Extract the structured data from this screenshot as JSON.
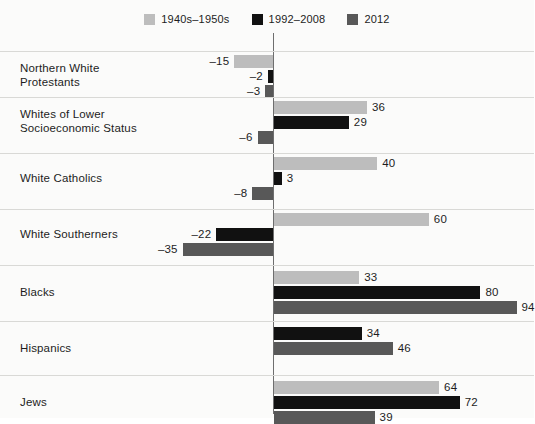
{
  "legend": {
    "position": "top-center",
    "entries": [
      {
        "label": "1940s–1950s",
        "color": "#bdbdbd",
        "key": "era1"
      },
      {
        "label": "1992–2008",
        "color": "#111111",
        "key": "era2"
      },
      {
        "label": "2012",
        "color": "#585858",
        "key": "era3"
      }
    ]
  },
  "axis": {
    "zero_line_color": "#6e6e6e",
    "gridline_color": "#d9d9d6",
    "min": -40,
    "max": 100
  },
  "chart_data": {
    "type": "bar",
    "orientation": "horizontal",
    "title": "",
    "subtitle": "",
    "xlabel": "",
    "ylabel": "",
    "xlim": [
      -40,
      100
    ],
    "grid": false,
    "legend_position": "top-center",
    "categories": [
      "Northern White Protestants",
      "Whites of Lower Socioeconomic Status",
      "White Catholics",
      "White Southerners",
      "Blacks",
      "Hispanics",
      "Jews"
    ],
    "series": [
      {
        "name": "1940s–1950s",
        "color": "#bdbdbd",
        "values": [
          -15,
          36,
          40,
          60,
          33,
          null,
          64
        ]
      },
      {
        "name": "1992–2008",
        "color": "#111111",
        "values": [
          -2,
          29,
          3,
          -22,
          80,
          34,
          72
        ]
      },
      {
        "name": "2012",
        "color": "#585858",
        "values": [
          -3,
          -6,
          -8,
          -35,
          94,
          46,
          39
        ]
      }
    ]
  },
  "groups": [
    {
      "label": "Northern White\nProtestants",
      "bars": [
        {
          "series": "1940s–1950s",
          "value": -15,
          "display": "–15",
          "color": "#bdbdbd"
        },
        {
          "series": "1992–2008",
          "value": -2,
          "display": "–2",
          "color": "#111111"
        },
        {
          "series": "2012",
          "value": -3,
          "display": "–3",
          "color": "#585858"
        }
      ]
    },
    {
      "label": "Whites of Lower\nSocioeconomic Status",
      "bars": [
        {
          "series": "1940s–1950s",
          "value": 36,
          "display": "36",
          "color": "#bdbdbd"
        },
        {
          "series": "1992–2008",
          "value": 29,
          "display": "29",
          "color": "#111111"
        },
        {
          "series": "2012",
          "value": -6,
          "display": "–6",
          "color": "#585858"
        }
      ]
    },
    {
      "label": "White Catholics",
      "bars": [
        {
          "series": "1940s–1950s",
          "value": 40,
          "display": "40",
          "color": "#bdbdbd"
        },
        {
          "series": "1992–2008",
          "value": 3,
          "display": "3",
          "color": "#111111"
        },
        {
          "series": "2012",
          "value": -8,
          "display": "–8",
          "color": "#585858"
        }
      ]
    },
    {
      "label": "White Southerners",
      "bars": [
        {
          "series": "1940s–1950s",
          "value": 60,
          "display": "60",
          "color": "#bdbdbd"
        },
        {
          "series": "1992–2008",
          "value": -22,
          "display": "–22",
          "color": "#111111"
        },
        {
          "series": "2012",
          "value": -35,
          "display": "–35",
          "color": "#585858"
        }
      ]
    },
    {
      "label": "Blacks",
      "bars": [
        {
          "series": "1940s–1950s",
          "value": 33,
          "display": "33",
          "color": "#bdbdbd"
        },
        {
          "series": "1992–2008",
          "value": 80,
          "display": "80",
          "color": "#111111"
        },
        {
          "series": "2012",
          "value": 94,
          "display": "94",
          "color": "#585858"
        }
      ]
    },
    {
      "label": "Hispanics",
      "bars": [
        {
          "series": "1992–2008",
          "value": 34,
          "display": "34",
          "color": "#111111"
        },
        {
          "series": "2012",
          "value": 46,
          "display": "46",
          "color": "#585858"
        }
      ]
    },
    {
      "label": "Jews",
      "bars": [
        {
          "series": "1940s–1950s",
          "value": 64,
          "display": "64",
          "color": "#bdbdbd"
        },
        {
          "series": "1992–2008",
          "value": 72,
          "display": "72",
          "color": "#111111"
        },
        {
          "series": "2012",
          "value": 39,
          "display": "39",
          "color": "#585858"
        }
      ]
    }
  ]
}
